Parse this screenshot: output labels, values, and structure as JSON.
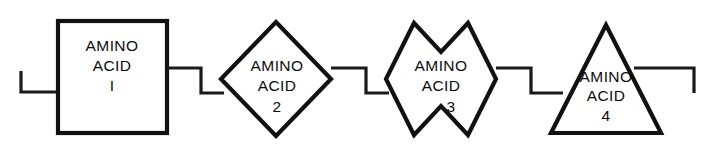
{
  "diagram": {
    "background_color": "#ffffff",
    "line_color": "#111111",
    "nodes": [
      {
        "id": "node-1",
        "shape": "square",
        "line_1": "AMINO",
        "line_2": "ACID",
        "index_label": "I"
      },
      {
        "id": "node-2",
        "shape": "diamond",
        "line_1": "AMINO",
        "line_2": "ACID",
        "index_label": "2"
      },
      {
        "id": "node-3",
        "shape": "notched-diamond",
        "line_1": "AMINO",
        "line_2": "ACID",
        "index_label": "3"
      },
      {
        "id": "node-4",
        "shape": "triangle",
        "line_1": "AMINO",
        "line_2": "ACID",
        "index_label": "4"
      }
    ],
    "connectors": [
      {
        "id": "connector-left-terminal",
        "kind": "bracket-open-left"
      },
      {
        "id": "connector-1-2",
        "kind": "step-down"
      },
      {
        "id": "connector-2-3",
        "kind": "step-down"
      },
      {
        "id": "connector-3-4",
        "kind": "step-down"
      },
      {
        "id": "connector-right-terminal",
        "kind": "bracket-open-right"
      }
    ]
  }
}
